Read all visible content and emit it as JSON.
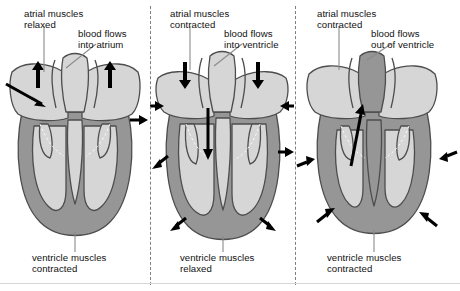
{
  "figure": {
    "colors": {
      "muscle_wall": "#969696",
      "chamber": "#d6d6d6",
      "valve": "#cfcfcf",
      "outline": "#4d4d4d",
      "arrow": "#000000",
      "divider": "#7d7d7d",
      "leader": "#8a8a8a",
      "text": "#111111",
      "background": "#ffffff"
    }
  },
  "panels": [
    {
      "id": "panel-1",
      "stage_name": "atrial-filling",
      "top_label": {
        "line1": "atrial muscles",
        "line2": "relaxed"
      },
      "flow_label": {
        "line1": "blood flows",
        "line2": "into atrium"
      },
      "bottom_label": {
        "line1": "ventricle muscles",
        "line2": "contracted"
      },
      "arrow_directions": [
        "up-left-wall",
        "up-right-wall",
        "in-from-left",
        "out-to-right"
      ]
    },
    {
      "id": "panel-2",
      "stage_name": "atrial-contraction",
      "top_label": {
        "line1": "atrial muscles",
        "line2": "contracted"
      },
      "flow_label": {
        "line1": "blood flows",
        "line2": "into ventricle"
      },
      "bottom_label": {
        "line1": "ventricle muscles",
        "line2": "relaxed"
      },
      "arrow_directions": [
        "down-left-atrium",
        "down-right-atrium",
        "in-left",
        "in-right",
        "out-right-mid",
        "out-lower-left",
        "out-lower-right",
        "down-through-valve"
      ]
    },
    {
      "id": "panel-3",
      "stage_name": "ventricular-contraction",
      "top_label": {
        "line1": "atrial muscles",
        "line2": "contracted"
      },
      "flow_label": {
        "line1": "blood flows",
        "line2": "out of ventricle"
      },
      "bottom_label": {
        "line1": "ventricle muscles",
        "line2": "contracted"
      },
      "arrow_directions": [
        "up-through-aorta",
        "in-left-mid",
        "in-right-mid",
        "in-lower-left",
        "in-lower-right"
      ]
    }
  ]
}
